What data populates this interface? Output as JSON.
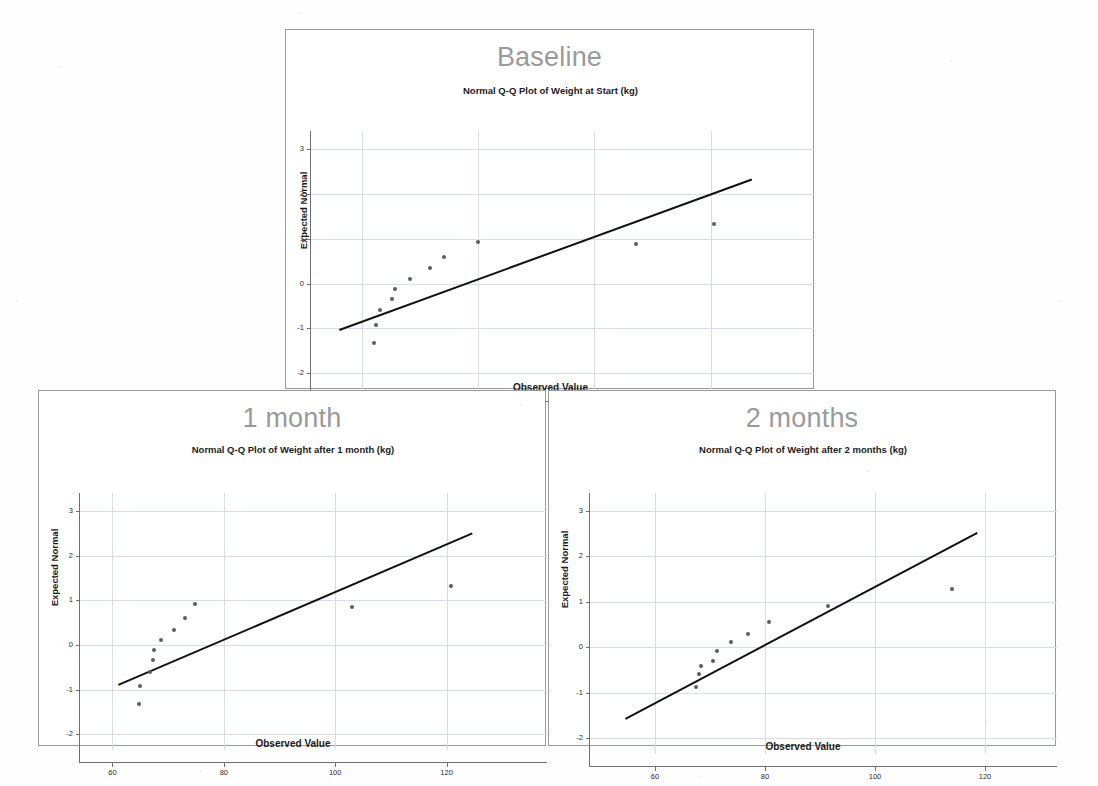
{
  "figure": {
    "background_color": "#ffffff",
    "panel_border_color": "#9a9a9a",
    "panel_title_color": "#9a9a9a",
    "grid_color": "#d8dde4",
    "marker_color": "#5d5d5d",
    "line_color": "#111111"
  },
  "panels": [
    {
      "name": "baseline",
      "title": "Baseline",
      "chart_index": 0
    },
    {
      "name": "one-month",
      "title": "1 month",
      "chart_index": 1
    },
    {
      "name": "two-months",
      "title": "2 months",
      "chart_index": 2
    }
  ],
  "chart_data": [
    {
      "type": "scatter",
      "title": "Normal Q-Q Plot of Weight at Start (kg)",
      "xlabel": "Observed Value",
      "ylabel": "Expected Normal",
      "xlim": [
        51,
        133
      ],
      "ylim": [
        -2.35,
        3.2
      ],
      "xticks": [
        60,
        80,
        100,
        120
      ],
      "yticks": [
        3,
        2,
        1,
        0,
        -1,
        -2
      ],
      "xticklabels": [
        "60",
        "80",
        "100",
        "120"
      ],
      "yticklabels": [
        "3",
        "2",
        "1",
        "0",
        "-1",
        "-2"
      ],
      "grid": true,
      "legend": "none",
      "points": [
        {
          "x": 62.0,
          "y": -1.33
        },
        {
          "x": 62.3,
          "y": -0.92
        },
        {
          "x": 63.1,
          "y": -0.6
        },
        {
          "x": 65.1,
          "y": -0.34
        },
        {
          "x": 65.6,
          "y": -0.11
        },
        {
          "x": 68.3,
          "y": 0.11
        },
        {
          "x": 71.6,
          "y": 0.34
        },
        {
          "x": 74.0,
          "y": 0.6
        },
        {
          "x": 80.0,
          "y": 0.92
        },
        {
          "x": 107.2,
          "y": 0.88
        },
        {
          "x": 120.6,
          "y": 1.33
        }
      ],
      "reference_line": {
        "x1": 56.0,
        "y1": -1.02,
        "x2": 127.0,
        "y2": 2.33
      }
    },
    {
      "type": "scatter",
      "title": "Normal Q-Q Plot of Weight after 1 month (kg)",
      "xlabel": "Observed Value",
      "ylabel": "Expected Normal",
      "xlim": [
        54,
        133
      ],
      "ylim": [
        -2.35,
        3.2
      ],
      "xticks": [
        60,
        80,
        100,
        120
      ],
      "yticks": [
        3,
        2,
        1,
        0,
        -1,
        -2
      ],
      "xticklabels": [
        "60",
        "80",
        "100",
        "120"
      ],
      "yticklabels": [
        "3",
        "2",
        "1",
        "0",
        "-1",
        "-2"
      ],
      "grid": true,
      "legend": "none",
      "points": [
        {
          "x": 64.7,
          "y": -1.33
        },
        {
          "x": 65.0,
          "y": -0.92
        },
        {
          "x": 66.7,
          "y": -0.6
        },
        {
          "x": 67.2,
          "y": -0.34
        },
        {
          "x": 67.5,
          "y": -0.11
        },
        {
          "x": 68.8,
          "y": 0.11
        },
        {
          "x": 71.0,
          "y": 0.34
        },
        {
          "x": 73.1,
          "y": 0.6
        },
        {
          "x": 74.8,
          "y": 0.92
        },
        {
          "x": 103.0,
          "y": 0.86
        },
        {
          "x": 120.8,
          "y": 1.31
        }
      ],
      "reference_line": {
        "x1": 61.0,
        "y1": -0.88,
        "x2": 124.5,
        "y2": 2.51
      }
    },
    {
      "type": "scatter",
      "title": "Normal Q-Q Plot of Weight after 2 months (kg)",
      "xlabel": "Observed Value",
      "ylabel": "Expected Normal",
      "xlim": [
        48,
        128
      ],
      "ylim": [
        -2.35,
        3.2
      ],
      "xticks": [
        60,
        80,
        100,
        120
      ],
      "yticks": [
        3,
        2,
        1,
        0,
        -1,
        -2
      ],
      "xticklabels": [
        "60",
        "80",
        "100",
        "120"
      ],
      "yticklabels": [
        "3",
        "2",
        "1",
        "0",
        "-1",
        "-2"
      ],
      "grid": true,
      "legend": "none",
      "points": [
        {
          "x": 67.4,
          "y": -0.88
        },
        {
          "x": 68.0,
          "y": -0.59
        },
        {
          "x": 68.4,
          "y": -0.42
        },
        {
          "x": 70.5,
          "y": -0.3
        },
        {
          "x": 71.2,
          "y": -0.09
        },
        {
          "x": 73.8,
          "y": 0.11
        },
        {
          "x": 76.9,
          "y": 0.3
        },
        {
          "x": 80.8,
          "y": 0.55
        },
        {
          "x": 91.5,
          "y": 0.9
        },
        {
          "x": 114.0,
          "y": 1.28
        }
      ],
      "reference_line": {
        "x1": 54.5,
        "y1": -1.55,
        "x2": 118.5,
        "y2": 2.55
      }
    }
  ]
}
